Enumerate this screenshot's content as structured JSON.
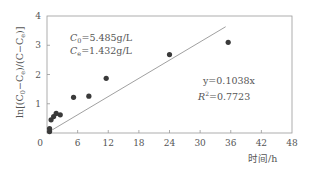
{
  "chart_data": {
    "type": "scatter",
    "title": "",
    "xlabel": "时间/h",
    "ylabel": "ln[(C0-Ce)/(C-Ce)]",
    "xlim": [
      0,
      48
    ],
    "ylim": [
      0,
      4
    ],
    "x_ticks": [
      0,
      6,
      12,
      18,
      24,
      30,
      36,
      42,
      48
    ],
    "y_ticks": [
      0,
      1,
      2,
      3,
      4
    ],
    "grid": false,
    "legend": null,
    "series": [
      {
        "name": "measured",
        "type": "scatter",
        "x": [
          0.5,
          0.5,
          0.8,
          1.3,
          1.8,
          2.6,
          5.2,
          8.2,
          11.6,
          24.0,
          35.5
        ],
        "y": [
          0.05,
          0.15,
          0.45,
          0.56,
          0.67,
          0.62,
          1.22,
          1.26,
          1.87,
          2.68,
          3.1
        ]
      },
      {
        "name": "fit",
        "type": "line",
        "x": [
          0,
          35
        ],
        "y": [
          0,
          3.633
        ]
      }
    ],
    "annotations": [
      {
        "text_main": "C",
        "sub": "0",
        "rest": "=5.485g/L"
      },
      {
        "text_main": "C",
        "sub": "e",
        "rest": "=1.432g/L"
      },
      {
        "text": "y=0.1038x"
      },
      {
        "text_main": "R",
        "sup": "2",
        "rest": "=0.7723"
      }
    ]
  },
  "labels": {
    "xlabel": "时间/h",
    "ylabel_prefix": "ln[(C",
    "ylabel_sub0": "0",
    "ylabel_mid": "−C",
    "ylabel_sub1": "e",
    "ylabel_mid2": ")/(C−C",
    "ylabel_sub2": "e",
    "ylabel_end": ")]",
    "c0_main": "C",
    "c0_sub": "0",
    "c0_rest": "=5.485g/L",
    "ce_main": "C",
    "ce_sub": "e",
    "ce_rest": "=1.432g/L",
    "eq": "y=0.1038x",
    "r2_main": "R",
    "r2_sup": "2",
    "r2_rest": "=0.7723"
  },
  "colors": {
    "axis": "#888888",
    "point": "#3a3a3a",
    "line": "#888888",
    "text": "#555555"
  }
}
